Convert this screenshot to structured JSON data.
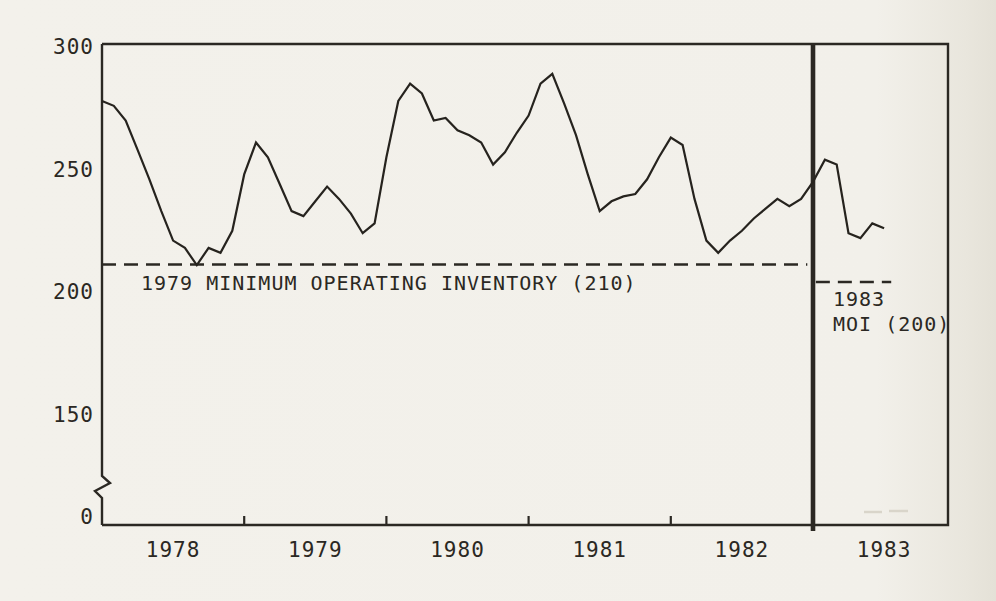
{
  "page": {
    "paper_color": "#f2f0ea",
    "ink_color": "#2b2823"
  },
  "chart_data": {
    "type": "line",
    "title": "",
    "xlabel": "",
    "ylabel": "",
    "grid": false,
    "legend": "none",
    "ylim_drawn": [
      150,
      300
    ],
    "y_axis_break_between": [
      0,
      150
    ],
    "y_ticks": [
      "300",
      "250",
      "200",
      "150",
      "0"
    ],
    "y_tick_values": [
      300,
      250,
      200,
      150,
      0
    ],
    "x_tick_years": [
      "1978",
      "1979",
      "1980",
      "1981",
      "1982",
      "1983"
    ],
    "series": [
      {
        "name": "inventory",
        "start": "1978-01",
        "interval": "monthly",
        "values": [
          278,
          276,
          270,
          258,
          246,
          233,
          221,
          218,
          211,
          218,
          216,
          225,
          248,
          261,
          255,
          244,
          233,
          231,
          237,
          243,
          238,
          232,
          224,
          228,
          255,
          278,
          285,
          281,
          270,
          271,
          266,
          264,
          261,
          252,
          257,
          265,
          272,
          285,
          289,
          277,
          264,
          248,
          233,
          237,
          239,
          240,
          246,
          255,
          263,
          260,
          238,
          221,
          216,
          221,
          225,
          230,
          234,
          238,
          235,
          238,
          245,
          254,
          252,
          224,
          222,
          228,
          226
        ]
      }
    ],
    "reference_lines": [
      {
        "value": 210,
        "label": "1979 MINIMUM OPERATING INVENTORY (210)",
        "style": "dashed",
        "span_years": [
          1978.0,
          1982.96
        ],
        "draw_offset_px": -3
      },
      {
        "value": 200,
        "label_line1": "1983",
        "label_line2": "MOI (200)",
        "style": "dashed",
        "span_years": [
          1983.02,
          1983.55
        ],
        "draw_offset_px": -10
      }
    ],
    "divider": {
      "at_year": 1983.0,
      "style": "thick-solid"
    }
  }
}
